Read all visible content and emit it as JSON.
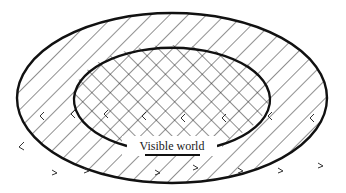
{
  "diagram": {
    "label": "Visible world",
    "colors": {
      "stroke": "#111111",
      "hatch": "#222222",
      "background": "#ffffff"
    },
    "outer_region": {
      "shape": "ellipse",
      "fill": "diagonal-hatch"
    },
    "inner_region": {
      "shape": "open-ellipse",
      "fill": "cross-hatch",
      "gap": "bottom"
    },
    "arrow_marks": "scattered small arrowheads around boundary"
  }
}
